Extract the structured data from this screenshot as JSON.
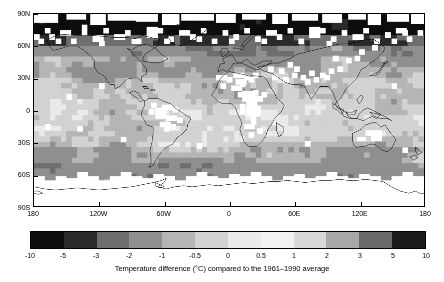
{
  "figure": {
    "kind": "global-temperature-anomaly-map",
    "background_color": "#ffffff",
    "frame_color": "#000000"
  },
  "map": {
    "projection": "equirectangular",
    "xlim": [
      -180,
      180
    ],
    "ylim": [
      -90,
      90
    ],
    "coastline_color": "#000000",
    "nodata_color": "#ffffff",
    "nodata_label": "no data"
  },
  "axes": {
    "x_ticks": [
      {
        "label": "180",
        "value": -180
      },
      {
        "label": "120W",
        "value": -120
      },
      {
        "label": "60W",
        "value": -60
      },
      {
        "label": "0",
        "value": 0
      },
      {
        "label": "60E",
        "value": 60
      },
      {
        "label": "120E",
        "value": 120
      },
      {
        "label": "180",
        "value": 180
      }
    ],
    "y_ticks": [
      {
        "label": "90N",
        "value": 90
      },
      {
        "label": "60N",
        "value": 60
      },
      {
        "label": "30N",
        "value": 30
      },
      {
        "label": "0",
        "value": 0
      },
      {
        "label": "30S",
        "value": -30
      },
      {
        "label": "60S",
        "value": -60
      },
      {
        "label": "90S",
        "value": -90
      }
    ]
  },
  "colorbar": {
    "caption": "Temperature difference (°C) compared to the 1961–1990 average",
    "orientation": "horizontal",
    "tick_labels": [
      "-10",
      "-5",
      "-3",
      "-2",
      "-1",
      "-0.5",
      "0",
      "0.5",
      "1",
      "2",
      "3",
      "5",
      "10"
    ],
    "boundaries": [
      -10,
      -5,
      -3,
      -2,
      -1,
      -0.5,
      0,
      0.5,
      1,
      2,
      3,
      5,
      10
    ],
    "band_colors": [
      "#0d0d0d",
      "#2b2b2b",
      "#6e6e6e",
      "#8f8f8f",
      "#b5b5b5",
      "#d2d2d2",
      "#eaeaea",
      "#f2f2f2",
      "#d8d8d8",
      "#a8a8a8",
      "#6a6a6a",
      "#1a1a1a"
    ]
  },
  "chart_data": {
    "type": "heatmap",
    "title": "",
    "subtitle": "",
    "xlabel": "",
    "ylabel": "",
    "colorbar_label": "Temperature difference (°C) compared to the 1961–1990 average",
    "xlim": [
      -180,
      180
    ],
    "ylim": [
      -90,
      90
    ],
    "grid": false,
    "legend_position": "bottom",
    "levels": [
      -10,
      -5,
      -3,
      -2,
      -1,
      -0.5,
      0,
      0.5,
      1,
      2,
      3,
      5,
      10
    ],
    "level_colors": [
      "#0d0d0d",
      "#2b2b2b",
      "#6e6e6e",
      "#8f8f8f",
      "#b5b5b5",
      "#d2d2d2",
      "#eaeaea",
      "#f2f2f2",
      "#d8d8d8",
      "#a8a8a8",
      "#6a6a6a",
      "#1a1a1a"
    ],
    "cell_size_deg": 5,
    "nodata_value": null,
    "regional_summary": [
      {
        "region": "Arctic (70N-90N)",
        "typical_anomaly": -6,
        "note": "strong dark cold band with many no-data cells"
      },
      {
        "region": "High northern latitudes (55N-70N)",
        "typical_anomaly": -2.5
      },
      {
        "region": "Northern mid-latitudes (30N-55N)",
        "typical_anomaly": -0.7
      },
      {
        "region": "Tropics (20S-20N)",
        "typical_anomaly": -0.3
      },
      {
        "region": "Southern mid-latitudes (20S-50S)",
        "typical_anomaly": -0.5
      },
      {
        "region": "Southern Ocean (50S-65S)",
        "typical_anomaly": -1.2
      },
      {
        "region": "Antarctica (65S-90S)",
        "typical_anomaly": null,
        "note": "predominantly no data"
      }
    ]
  }
}
